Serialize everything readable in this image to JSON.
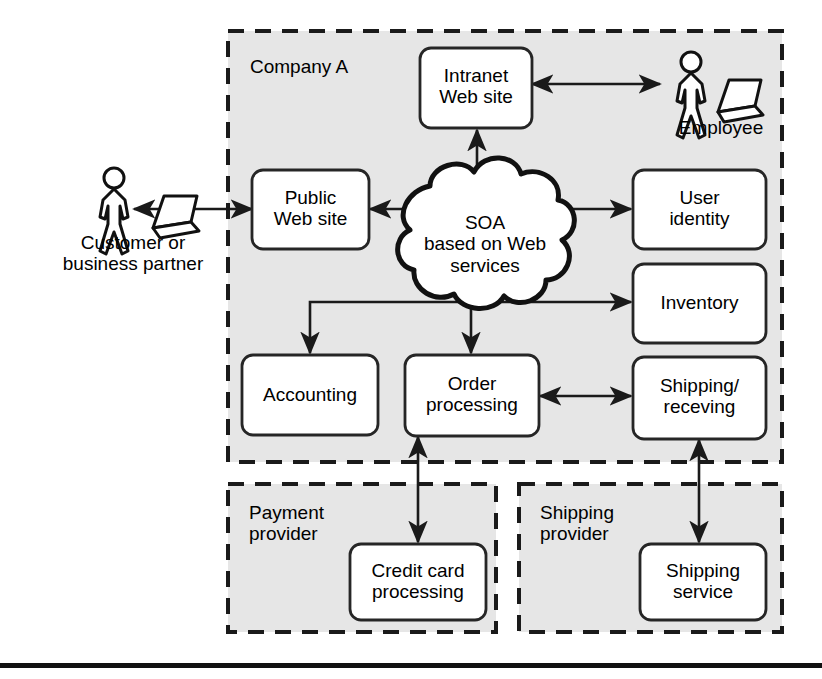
{
  "diagram": {
    "colors": {
      "zone_fill": "#e6e6e6",
      "zone_border": "#1a1a1a",
      "node_fill": "#ffffff",
      "node_border": "#262626",
      "line": "#1a1a1a",
      "rule": "#111111",
      "page_background": "#ffffff"
    },
    "zones": [
      {
        "id": "company-a",
        "label": "Company A"
      },
      {
        "id": "payment-provider",
        "label": "Payment\nprovider"
      },
      {
        "id": "shipping-provider",
        "label": "Shipping\nprovider"
      }
    ],
    "cloud": {
      "id": "soa-cloud",
      "label": "SOA\nbased on Web\nservices"
    },
    "nodes": [
      {
        "id": "intranet-web-site",
        "label": "Intranet\nWeb site"
      },
      {
        "id": "public-web-site",
        "label": "Public\nWeb site"
      },
      {
        "id": "user-identity",
        "label": "User\nidentity"
      },
      {
        "id": "inventory",
        "label": "Inventory"
      },
      {
        "id": "shipping-receving",
        "label": "Shipping/\nreceving"
      },
      {
        "id": "accounting",
        "label": "Accounting"
      },
      {
        "id": "order-processing",
        "label": "Order\nprocessing"
      },
      {
        "id": "credit-card-processing",
        "label": "Credit card\nprocessing"
      },
      {
        "id": "shipping-service",
        "label": "Shipping\nservice"
      }
    ],
    "actors": [
      {
        "id": "customer-actor",
        "label": "Customer or\nbusiness partner",
        "icon": "person-with-laptop-icon"
      },
      {
        "id": "employee-actor",
        "label": "Employee",
        "icon": "person-with-laptop-icon"
      }
    ],
    "connectors": [
      {
        "id": "customer-to-public-web-site",
        "from": "customer-actor",
        "to": "public-web-site",
        "arrows": "both"
      },
      {
        "id": "intranet-to-employee",
        "from": "intranet-web-site",
        "to": "employee-actor",
        "arrows": "both"
      },
      {
        "id": "cloud-to-intranet",
        "from": "soa-cloud",
        "to": "intranet-web-site",
        "arrows": "to"
      },
      {
        "id": "cloud-to-public-web-site",
        "from": "soa-cloud",
        "to": "public-web-site",
        "arrows": "to"
      },
      {
        "id": "cloud-to-user-identity",
        "from": "soa-cloud",
        "to": "user-identity",
        "arrows": "to"
      },
      {
        "id": "cloud-to-inventory",
        "from": "soa-cloud",
        "to": "inventory",
        "arrows": "to"
      },
      {
        "id": "cloud-to-accounting",
        "from": "soa-cloud",
        "to": "accounting",
        "arrows": "to"
      },
      {
        "id": "cloud-to-order-processing",
        "from": "soa-cloud",
        "to": "order-processing",
        "arrows": "to"
      },
      {
        "id": "order-processing-to-shipping-receving",
        "from": "order-processing",
        "to": "shipping-receving",
        "arrows": "both"
      },
      {
        "id": "order-processing-to-credit-card-processing",
        "from": "order-processing",
        "to": "credit-card-processing",
        "arrows": "both"
      },
      {
        "id": "shipping-receving-to-shipping-service",
        "from": "shipping-receving",
        "to": "shipping-service",
        "arrows": "both"
      }
    ],
    "footer_rule": {
      "id": "bottom-rule"
    }
  }
}
